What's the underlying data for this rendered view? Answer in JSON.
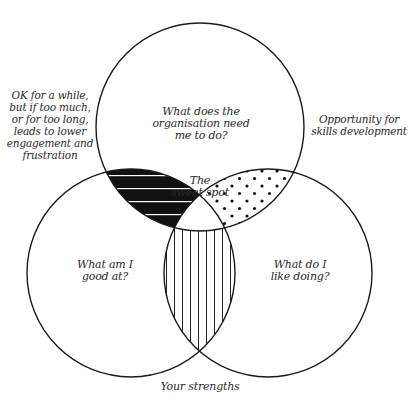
{
  "diagram": {
    "type": "three-circle venn",
    "circles": [
      {
        "id": "top",
        "label": "What does the\norganisation need\nme to do?"
      },
      {
        "id": "bottom-left",
        "label": "What am I\ngood at?"
      },
      {
        "id": "bottom-right",
        "label": "What do I\nlike doing?"
      }
    ],
    "intersections": {
      "center": "The\nsweet spot",
      "top_left_pattern": "black with white horizontal stripes",
      "top_right_pattern": "dots",
      "bottom_pattern": "vertical lines"
    },
    "annotations": {
      "left": "OK for a while,\nbut if too much,\nor for too long,\nleads to lower\nengagement and\nfrustration",
      "right": "Opportunity for\nskills development",
      "bottom": "Your strengths"
    },
    "colors": {
      "stroke": "#1a1a1a",
      "fill": "#ffffff",
      "text": "#2a2a2a"
    }
  }
}
